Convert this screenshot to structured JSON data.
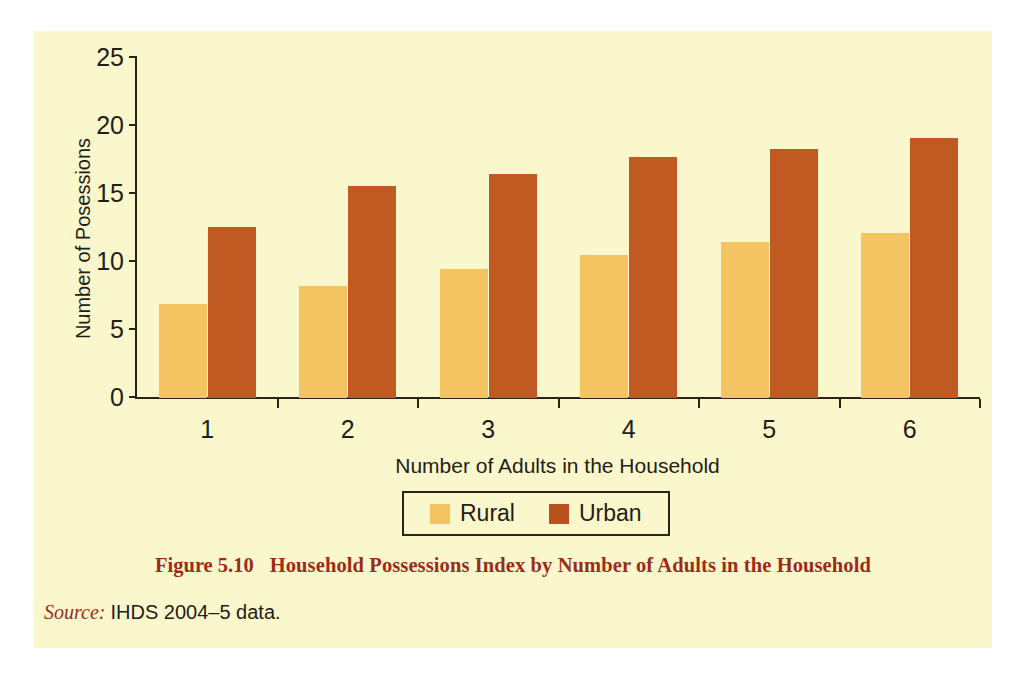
{
  "figure": {
    "caption_label": "Figure 5.10",
    "caption_title": "Household Possessions Index by Number of Adults in the Household",
    "source_label": "Source:",
    "source_value": "IHDS 2004–5 data."
  },
  "colors": {
    "background": "#fbf7cd",
    "page": "#ffffff",
    "rural": "#f5c462",
    "urban": "#c05a22",
    "axis": "#2b2317",
    "caption_red": "#9e2b18",
    "text": "#231d14"
  },
  "legend": {
    "position": "bottom-center",
    "entries": [
      {
        "label": "Rural",
        "color": "#f5c462"
      },
      {
        "label": "Urban",
        "color": "#b9511d"
      }
    ]
  },
  "chart_data": {
    "type": "bar",
    "title": "Household Possessions Index by Number of Adults in the Household",
    "xlabel": "Number of Adults in the Household",
    "ylabel": "Number of Posessions",
    "categories": [
      "1",
      "2",
      "3",
      "4",
      "5",
      "6"
    ],
    "series": [
      {
        "name": "Rural",
        "color": "#f5c462",
        "values": [
          6.9,
          8.2,
          9.5,
          10.5,
          11.5,
          12.1
        ]
      },
      {
        "name": "Urban",
        "color": "#c05a22",
        "values": [
          12.6,
          15.6,
          16.5,
          17.7,
          18.3,
          19.1
        ]
      }
    ],
    "ylim": [
      0,
      25
    ],
    "yticks": [
      0,
      5,
      10,
      15,
      20,
      25
    ],
    "ytick_labels": [
      "0",
      "5",
      "10",
      "15",
      "20",
      "25"
    ],
    "grid": false,
    "legend_position": "bottom-center"
  }
}
